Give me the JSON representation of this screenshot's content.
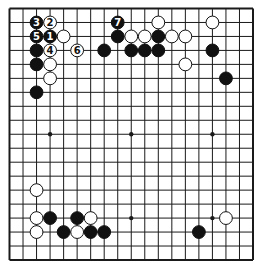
{
  "diagram": {
    "type": "go-board",
    "size": 19,
    "colors": {
      "background": "#ffffff",
      "line": "#1a1a1a",
      "black_stone": "#111111",
      "white_stone": "#ffffff",
      "stone_outline": "#111111"
    },
    "star_points": [
      [
        3,
        3
      ],
      [
        3,
        9
      ],
      [
        3,
        15
      ],
      [
        9,
        3
      ],
      [
        9,
        9
      ],
      [
        9,
        15
      ],
      [
        15,
        3
      ],
      [
        15,
        9
      ],
      [
        15,
        15
      ]
    ],
    "stones": [
      {
        "col": 2,
        "row": 1,
        "color": "black",
        "label": "3"
      },
      {
        "col": 3,
        "row": 1,
        "color": "white",
        "label": "2"
      },
      {
        "col": 2,
        "row": 2,
        "color": "black",
        "label": "5"
      },
      {
        "col": 3,
        "row": 2,
        "color": "black",
        "label": "1"
      },
      {
        "col": 4,
        "row": 2,
        "color": "white",
        "label": ""
      },
      {
        "col": 2,
        "row": 3,
        "color": "black",
        "label": ""
      },
      {
        "col": 3,
        "row": 3,
        "color": "white",
        "label": "4"
      },
      {
        "col": 5,
        "row": 3,
        "color": "white",
        "label": "6"
      },
      {
        "col": 2,
        "row": 4,
        "color": "black",
        "label": ""
      },
      {
        "col": 3,
        "row": 4,
        "color": "white",
        "label": ""
      },
      {
        "col": 3,
        "row": 5,
        "color": "white",
        "label": ""
      },
      {
        "col": 2,
        "row": 6,
        "color": "black",
        "label": ""
      },
      {
        "col": 8,
        "row": 1,
        "color": "black",
        "label": "7"
      },
      {
        "col": 8,
        "row": 2,
        "color": "black",
        "label": ""
      },
      {
        "col": 7,
        "row": 3,
        "color": "black",
        "label": ""
      },
      {
        "col": 9,
        "row": 2,
        "color": "white",
        "label": ""
      },
      {
        "col": 10,
        "row": 2,
        "color": "white",
        "label": ""
      },
      {
        "col": 11,
        "row": 1,
        "color": "white",
        "label": ""
      },
      {
        "col": 11,
        "row": 2,
        "color": "black",
        "label": ""
      },
      {
        "col": 12,
        "row": 2,
        "color": "white",
        "label": ""
      },
      {
        "col": 13,
        "row": 2,
        "color": "white",
        "label": ""
      },
      {
        "col": 9,
        "row": 3,
        "color": "black",
        "label": ""
      },
      {
        "col": 10,
        "row": 3,
        "color": "black",
        "label": ""
      },
      {
        "col": 11,
        "row": 3,
        "color": "black",
        "label": ""
      },
      {
        "col": 13,
        "row": 4,
        "color": "white",
        "label": ""
      },
      {
        "col": 15,
        "row": 1,
        "color": "white",
        "label": ""
      },
      {
        "col": 15,
        "row": 3,
        "color": "black",
        "label": ""
      },
      {
        "col": 16,
        "row": 5,
        "color": "black",
        "label": ""
      },
      {
        "col": 2,
        "row": 13,
        "color": "white",
        "label": ""
      },
      {
        "col": 2,
        "row": 15,
        "color": "white",
        "label": ""
      },
      {
        "col": 3,
        "row": 15,
        "color": "black",
        "label": ""
      },
      {
        "col": 5,
        "row": 15,
        "color": "black",
        "label": ""
      },
      {
        "col": 6,
        "row": 15,
        "color": "white",
        "label": ""
      },
      {
        "col": 2,
        "row": 16,
        "color": "white",
        "label": ""
      },
      {
        "col": 4,
        "row": 16,
        "color": "black",
        "label": ""
      },
      {
        "col": 5,
        "row": 16,
        "color": "white",
        "label": ""
      },
      {
        "col": 6,
        "row": 16,
        "color": "black",
        "label": ""
      },
      {
        "col": 7,
        "row": 16,
        "color": "black",
        "label": ""
      },
      {
        "col": 16,
        "row": 15,
        "color": "white",
        "label": ""
      },
      {
        "col": 14,
        "row": 16,
        "color": "black",
        "label": ""
      }
    ]
  }
}
